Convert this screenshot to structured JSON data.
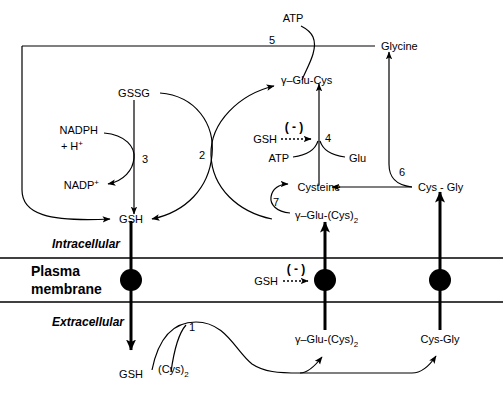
{
  "diagram": {
    "compartments": {
      "intracellular_label": "Intracellular",
      "membrane_label_line1": "Plasma",
      "membrane_label_line2": "membrane",
      "extracellular_label": "Extracellular"
    },
    "metabolites": {
      "atp_top": "ATP",
      "atp_enzyme4": "ATP",
      "glycine": "Glycine",
      "gssg": "GSSG",
      "gamma_glu_cys": "γ–Glu-Cys",
      "nadph": "NADPH",
      "nadph_h": "+ H",
      "nadph_h_sup": "+",
      "nadp": "NADP",
      "nadp_sup": "+",
      "gsh_inhib_enzyme4": "GSH",
      "glu": "Glu",
      "cysteine": "Cysteine",
      "cys_gly_intra": "Cys - Gly",
      "gsh_intracellular": "GSH",
      "gamma_glu_cys2_intra_pre": "γ–Glu-(Cys)",
      "gamma_glu_cys2_intra_sub": "2",
      "gsh_inhib_membrane": "GSH",
      "gsh_extracellular": "GSH",
      "cys2_extracellular_pre": "(Cys)",
      "cys2_extracellular_sub": "2",
      "gamma_glu_cys2_extra_pre": "γ–Glu-(Cys)",
      "gamma_glu_cys2_extra_sub": "2",
      "cys_gly_extra": "Cys-Gly"
    },
    "enzyme_numbers": {
      "n1": "1",
      "n2": "2",
      "n3": "3",
      "n4": "4",
      "n5": "5",
      "n6": "6",
      "n7": "7"
    },
    "inhibition": {
      "symbol_enzyme4": "( - )",
      "symbol_membrane": "( - )"
    },
    "colors": {
      "stroke": "#000000",
      "background": "#ffffff",
      "transporter": "#000000"
    }
  }
}
